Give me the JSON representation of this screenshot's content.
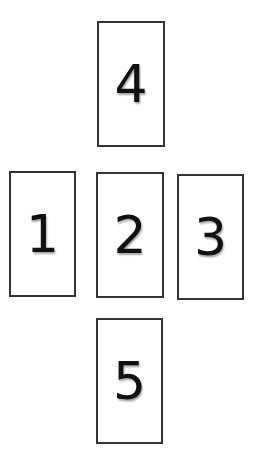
{
  "diagram": {
    "type": "cross-layout card spread",
    "cards": [
      {
        "position": 1,
        "label": "1",
        "x": 9,
        "y": 171,
        "w": 67,
        "h": 126
      },
      {
        "position": 2,
        "label": "2",
        "x": 96,
        "y": 172,
        "w": 68,
        "h": 126
      },
      {
        "position": 3,
        "label": "3",
        "x": 177,
        "y": 174,
        "w": 67,
        "h": 126
      },
      {
        "position": 4,
        "label": "4",
        "x": 97,
        "y": 21,
        "w": 68,
        "h": 126
      },
      {
        "position": 5,
        "label": "5",
        "x": 96,
        "y": 318,
        "w": 67,
        "h": 126
      }
    ]
  },
  "colors": {
    "border": "#333333",
    "text": "#111111",
    "background": "#ffffff"
  }
}
